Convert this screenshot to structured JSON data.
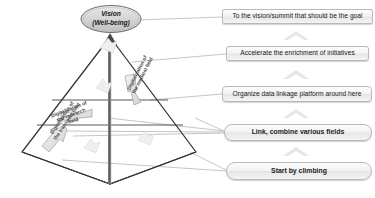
{
  "diagram": {
    "title_vision_line1": "Vision",
    "title_vision_line2": "(Well-being)",
    "pyramid_labels": [
      {
        "name": "research-field",
        "text_line1": "Digitalization of",
        "text_line2": "the research",
        "text_line3": "field"
      },
      {
        "name": "medical-field",
        "text_line1": "Digitalization of",
        "text_line2": "the medical field"
      },
      {
        "name": "transport-field",
        "text_line1": "Digitalization of",
        "text_line2": "the transport field"
      }
    ],
    "callouts": [
      {
        "id": "goal",
        "label": "To the vision/summit that should be the goal"
      },
      {
        "id": "enrich",
        "label": "Accelerate the enrichment of initiatives"
      },
      {
        "id": "platform",
        "label": "Organize data linkage platform around here"
      },
      {
        "id": "link",
        "label": "Link, combine various fields"
      },
      {
        "id": "start",
        "label": "Start by climbing"
      }
    ],
    "colors": {
      "outline": "#3a3a3a",
      "leader_line": "#b5b5b5",
      "ellipse_fill": "#d6d6d6",
      "ellipse_stroke": "#6e6e6e",
      "arrow_fill": "#e2e2e2",
      "arrow_stroke": "#9a9a9a",
      "chevron": "#e4e4e4",
      "box_border": "#b9b9b9",
      "text": "#1a1a1a"
    }
  }
}
